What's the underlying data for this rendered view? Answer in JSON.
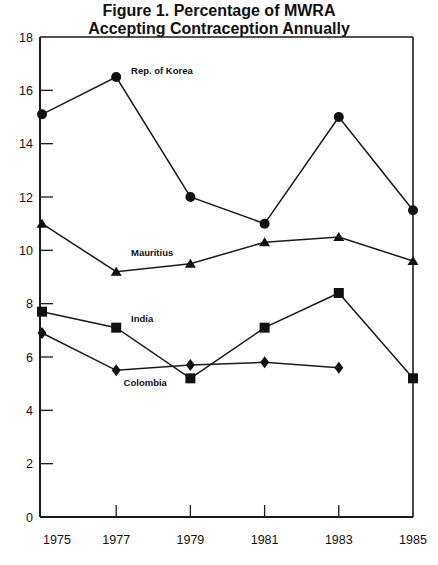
{
  "chart_data": {
    "type": "line",
    "title": "Figure 1. Percentage of MWRA Accepting Contraception Annually",
    "title_lines": [
      "Figure 1. Percentage of MWRA",
      "Accepting Contraception Annually"
    ],
    "xlabel": "",
    "ylabel": "",
    "x": [
      1975,
      1977,
      1979,
      1981,
      1983,
      1985
    ],
    "xticks": [
      "1975",
      "1977",
      "1979",
      "1981",
      "1983",
      "1985"
    ],
    "yticks": [
      "0",
      "2",
      "4",
      "6",
      "8",
      "10",
      "12",
      "14",
      "16",
      "18"
    ],
    "ylim": [
      0,
      18
    ],
    "xlim": [
      1975,
      1985
    ],
    "grid": false,
    "legend": "inline labels",
    "series": [
      {
        "name": "Rep. of Korea",
        "marker": "circle",
        "values": [
          15.1,
          16.5,
          12.0,
          11.0,
          15.0,
          11.5
        ]
      },
      {
        "name": "Mauritius",
        "marker": "triangle",
        "values": [
          11.0,
          9.2,
          9.5,
          10.3,
          10.5,
          9.6
        ]
      },
      {
        "name": "India",
        "marker": "square",
        "values": [
          7.7,
          7.1,
          5.2,
          7.1,
          8.4,
          5.2
        ]
      },
      {
        "name": "Colombia",
        "marker": "diamond",
        "values": [
          6.9,
          5.5,
          5.7,
          5.8,
          5.6,
          null
        ]
      }
    ],
    "annotations": [
      {
        "text": "Rep. of Korea",
        "x": 1977.4,
        "y": 16.6
      },
      {
        "text": "Mauritius",
        "x": 1977.4,
        "y": 9.8
      },
      {
        "text": "India",
        "x": 1977.4,
        "y": 7.3
      },
      {
        "text": "Colombia",
        "x": 1977.2,
        "y": 4.9
      }
    ]
  }
}
